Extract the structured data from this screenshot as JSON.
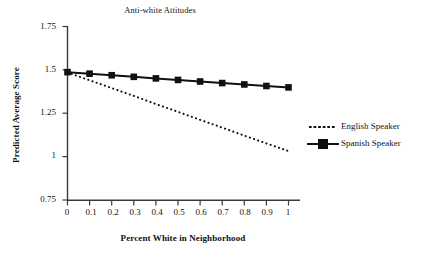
{
  "chart_data": {
    "type": "line",
    "title": "Anti-white Attitudes",
    "xlabel": "Percent White in Neighborhood",
    "ylabel": "Predicted Average Score",
    "x": [
      0,
      0.1,
      0.2,
      0.3,
      0.4,
      0.5,
      0.6,
      0.7,
      0.8,
      0.9,
      1
    ],
    "xticklabels": [
      "0",
      "0.1",
      "0.2",
      "0.3",
      "0.4",
      "0.5",
      "0.6",
      "0.7",
      "0.8",
      "0.9",
      "1"
    ],
    "yticklabels": [
      "1.75",
      "1.5",
      "1.25",
      "1",
      "0.75"
    ],
    "yticks": [
      1.75,
      1.5,
      1.25,
      1,
      0.75
    ],
    "xlim": [
      0,
      1
    ],
    "ylim": [
      0.75,
      1.75
    ],
    "grid": false,
    "legend_position": "right",
    "series": [
      {
        "name": "English Speaker",
        "style": "dotted",
        "marker": "none",
        "color": "#111111",
        "values": [
          1.485,
          1.44,
          1.395,
          1.35,
          1.303,
          1.258,
          1.212,
          1.167,
          1.121,
          1.076,
          1.032
        ]
      },
      {
        "name": "Spanish Speaker",
        "style": "solid",
        "marker": "square",
        "color": "#111111",
        "values": [
          1.487,
          1.478,
          1.469,
          1.46,
          1.451,
          1.442,
          1.433,
          1.424,
          1.416,
          1.407,
          1.399
        ]
      }
    ]
  },
  "legend": {
    "items": [
      {
        "label": "English Speaker",
        "key": "dotted-line-key"
      },
      {
        "label": "Spanish Speaker",
        "key": "solid-line-square-marker-key"
      }
    ]
  }
}
